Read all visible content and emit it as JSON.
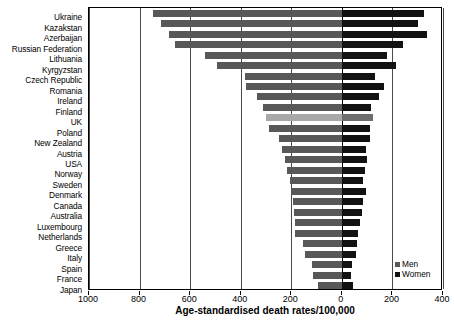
{
  "chart_data": {
    "type": "bar",
    "orientation": "horizontal",
    "style": "bidirectional-population-pyramid",
    "title": "",
    "xlabel": "Age-standardised death rates/100,000",
    "ylabel": "",
    "xlim": [
      -1000,
      400
    ],
    "xticks": [
      1000,
      800,
      600,
      400,
      200,
      0,
      200,
      400
    ],
    "xtick_labels": [
      "1000",
      "800",
      "600",
      "400",
      "200",
      "0",
      "200",
      "400"
    ],
    "grid": true,
    "legend_position": "bottom-right",
    "categories": [
      "Ukraine",
      "Kazakstan",
      "Azerbaijan",
      "Russian Federation",
      "Lithuania",
      "Kyrgyzstan",
      "Czech Republic",
      "Romania",
      "Ireland",
      "Finland",
      "UK",
      "Poland",
      "New Zealand",
      "Austria",
      "USA",
      "Norway",
      "Sweden",
      "Denmark",
      "Canada",
      "Australia",
      "Luxembourg",
      "Netherlands",
      "Greece",
      "Italy",
      "Spain",
      "France",
      "Japan"
    ],
    "series": [
      {
        "name": "Men",
        "direction": "left",
        "color": "#585858",
        "values": [
          745,
          715,
          685,
          660,
          540,
          495,
          385,
          380,
          335,
          310,
          300,
          290,
          250,
          235,
          225,
          215,
          205,
          200,
          195,
          190,
          185,
          185,
          155,
          145,
          120,
          115,
          95
        ]
      },
      {
        "name": "Women",
        "direction": "right",
        "color": "#121212",
        "values": [
          325,
          300,
          335,
          240,
          180,
          215,
          130,
          165,
          145,
          115,
          125,
          110,
          110,
          95,
          100,
          90,
          85,
          95,
          85,
          80,
          70,
          65,
          60,
          55,
          40,
          35,
          45
        ]
      }
    ],
    "highlight_category": "UK",
    "highlight_colors": {
      "men": "#a8a8a8",
      "women": "#6e6e6e"
    }
  },
  "legend": {
    "items": [
      {
        "label": "Men",
        "color": "#585858"
      },
      {
        "label": "Women",
        "color": "#121212"
      }
    ]
  }
}
